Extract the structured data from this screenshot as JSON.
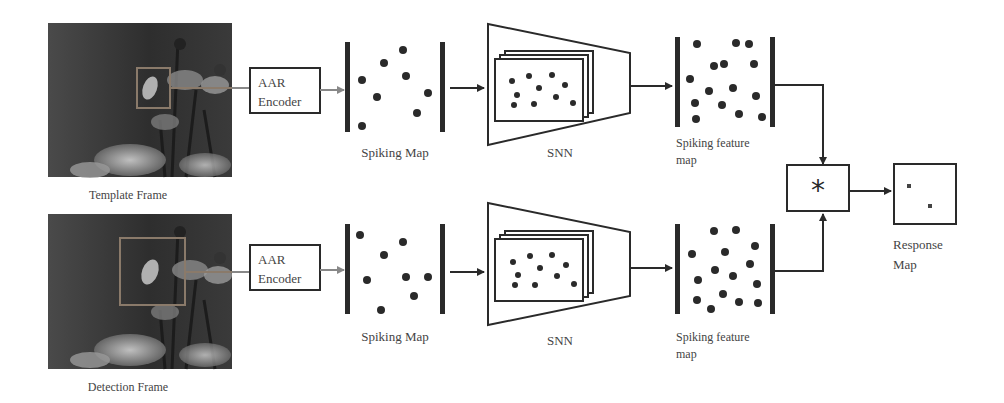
{
  "diagram": {
    "type": "pipeline",
    "rows": [
      {
        "id": "template",
        "frame_label": "Template Frame",
        "encoder_label_1": "AAR",
        "encoder_label_2": "Encoder",
        "spiking_map_label": "Spiking Map",
        "snn_label": "SNN",
        "feature_map_label_1": "Spiking feature",
        "feature_map_label_2": "map"
      },
      {
        "id": "detection",
        "frame_label": "Detection Frame",
        "encoder_label_1": "AAR",
        "encoder_label_2": "Encoder",
        "spiking_map_label": "Spiking Map",
        "snn_label": "SNN",
        "feature_map_label_1": "Spiking feature",
        "feature_map_label_2": "map"
      }
    ],
    "correlation": {
      "symbol": "*"
    },
    "response": {
      "label_1": "Response",
      "label_2": "Map"
    }
  },
  "colors": {
    "stroke": "#2a2a2a",
    "text": "#444444",
    "bbox": "#8a7a6a",
    "photo_bg": "#3a3a3a"
  }
}
